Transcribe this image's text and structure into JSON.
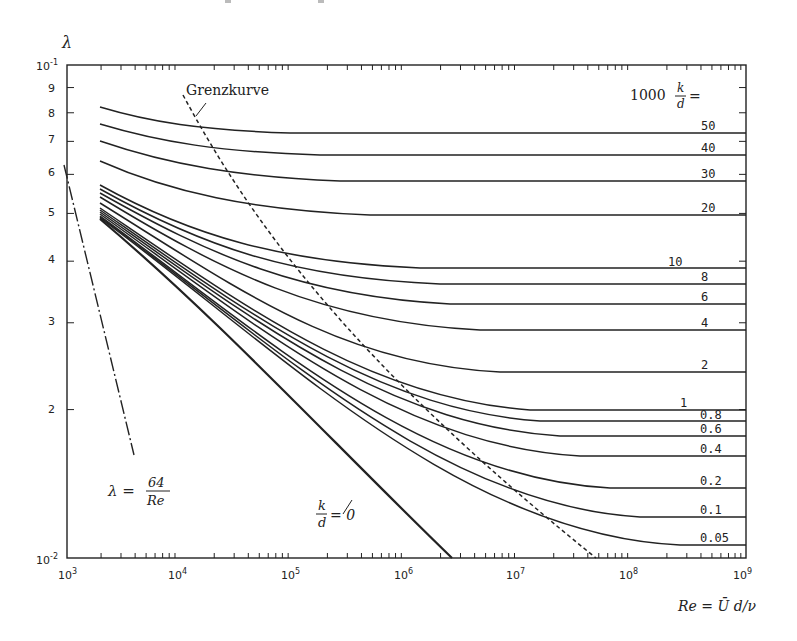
{
  "chart_data": {
    "type": "line",
    "title": "",
    "xlabel": "Re = Ū d/ν",
    "ylabel": "λ",
    "x_scale": "log",
    "y_scale": "log",
    "xlim": [
      1000,
      1000000000
    ],
    "ylim": [
      0.01,
      0.1
    ],
    "grid": false,
    "x_ticks": [
      "10³",
      "10⁴",
      "10⁵",
      "10⁶",
      "10⁷",
      "10⁸",
      "10⁹"
    ],
    "y_ticks": [
      "10⁻²",
      "2",
      "3",
      "4",
      "5",
      "6",
      "7",
      "8",
      "9",
      "10⁻¹"
    ],
    "legend_header": "1000 k/d =",
    "annotations": [
      "Grenzkurve",
      "λ = 64/Re",
      "k/d = 0"
    ],
    "series": [
      {
        "name": "1000 k/d = 50",
        "label": "50",
        "plateau_lambda": 0.0728
      },
      {
        "name": "1000 k/d = 40",
        "label": "40",
        "plateau_lambda": 0.0656
      },
      {
        "name": "1000 k/d = 30",
        "label": "30",
        "plateau_lambda": 0.0582
      },
      {
        "name": "1000 k/d = 20",
        "label": "20",
        "plateau_lambda": 0.0497
      },
      {
        "name": "1000 k/d = 10",
        "label": "10",
        "plateau_lambda": 0.0388
      },
      {
        "name": "1000 k/d = 8",
        "label": "8",
        "plateau_lambda": 0.036
      },
      {
        "name": "1000 k/d = 6",
        "label": "6",
        "plateau_lambda": 0.0327
      },
      {
        "name": "1000 k/d = 4",
        "label": "4",
        "plateau_lambda": 0.029
      },
      {
        "name": "1000 k/d = 2",
        "label": "2",
        "plateau_lambda": 0.0238
      },
      {
        "name": "1000 k/d = 1",
        "label": "1",
        "plateau_lambda": 0.02
      },
      {
        "name": "1000 k/d = 0.8",
        "label": "0.8",
        "plateau_lambda": 0.019
      },
      {
        "name": "1000 k/d = 0.6",
        "label": "0.6",
        "plateau_lambda": 0.0177
      },
      {
        "name": "1000 k/d = 0.4",
        "label": "0.4",
        "plateau_lambda": 0.0161
      },
      {
        "name": "1000 k/d = 0.2",
        "label": "0.2",
        "plateau_lambda": 0.0139
      },
      {
        "name": "1000 k/d = 0.1",
        "label": "0.1",
        "plateau_lambda": 0.0121
      },
      {
        "name": "1000 k/d = 0.05",
        "label": "0.05",
        "plateau_lambda": 0.0106
      },
      {
        "name": "k/d = 0 (smooth)",
        "label": "k/d = 0",
        "x": [
          2000,
          10000,
          100000,
          1000000,
          2500000
        ],
        "y": [
          0.05,
          0.031,
          0.018,
          0.0117,
          0.01
        ]
      },
      {
        "name": "Laminar λ = 64/Re",
        "label": "λ = 64/Re",
        "x": [
          1000,
          3800
        ],
        "y": [
          0.064,
          0.0168
        ],
        "style": "dash-dot"
      },
      {
        "name": "Grenzkurve",
        "label": "Grenzkurve",
        "x": [
          17000,
          100000,
          1000000,
          10000000,
          45000000
        ],
        "y": [
          0.083,
          0.04,
          0.0205,
          0.0135,
          0.01
        ],
        "style": "dashed"
      }
    ]
  },
  "labels": {
    "y_axis": "λ",
    "x_axis": "Re = Ū d/ν",
    "grenzkurve": "Grenzkurve",
    "legend_prefix": "1000",
    "legend_k": "k",
    "legend_d": "d",
    "legend_eq": "=",
    "laminar_lhs": "λ =",
    "laminar_num": "64",
    "laminar_den": "Re",
    "smooth_k": "k",
    "smooth_d": "d",
    "smooth_eq": "= 0"
  },
  "ticks": {
    "x": [
      "10",
      "10",
      "10",
      "10",
      "10",
      "10",
      "10"
    ],
    "x_exp": [
      "3",
      "4",
      "5",
      "6",
      "7",
      "8",
      "9"
    ],
    "y_top": "10",
    "y_top_exp": "-1",
    "y_bottom": "10",
    "y_bottom_exp": "-2",
    "y_minor": [
      "9",
      "8",
      "7",
      "6",
      "5",
      "4",
      "3",
      "2"
    ]
  },
  "curve_labels": [
    "50",
    "40",
    "30",
    "20",
    "10",
    "8",
    "6",
    "4",
    "2",
    "1",
    "0.8",
    "0.6",
    "0.4",
    "0.2",
    "0.1",
    "0.05"
  ]
}
